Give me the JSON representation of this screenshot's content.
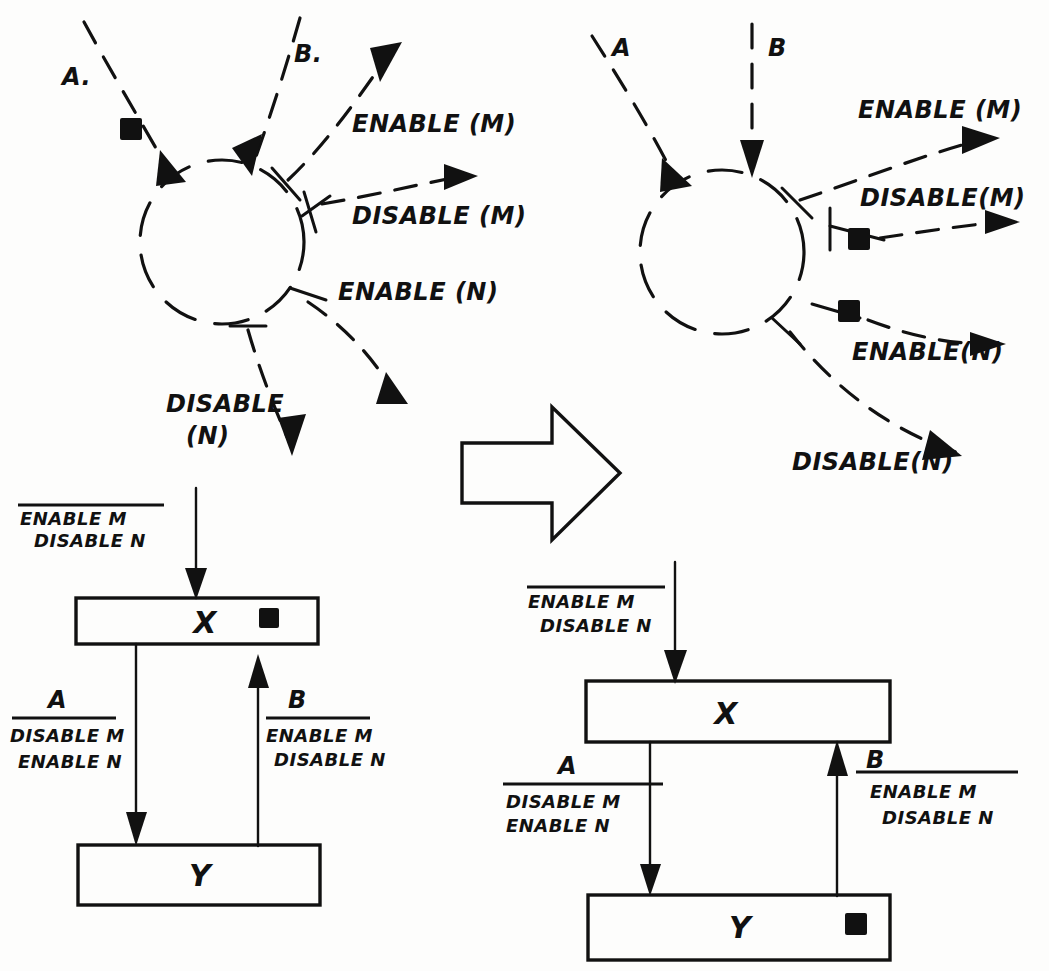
{
  "figure": {
    "transform_arrow": "block-right-arrow"
  },
  "left_net": {
    "inputs": [
      {
        "id": "A",
        "label": "A."
      },
      {
        "id": "B",
        "label": "B."
      }
    ],
    "outputs": [
      {
        "id": "enable_m",
        "label": "ENABLE (M)"
      },
      {
        "id": "disable_m",
        "label": "DISABLE (M)"
      },
      {
        "id": "enable_n",
        "label": "ENABLE (N)"
      },
      {
        "id": "disable_n",
        "label": "DISABLE",
        "label2": "(N)"
      }
    ],
    "tokens": [
      {
        "on": "A",
        "count": 1
      }
    ]
  },
  "right_net": {
    "inputs": [
      {
        "id": "A",
        "label": "A"
      },
      {
        "id": "B",
        "label": "B"
      }
    ],
    "outputs": [
      {
        "id": "enable_m",
        "label": "ENABLE (M)"
      },
      {
        "id": "disable_m",
        "label": "DISABLE(M)"
      },
      {
        "id": "enable_n",
        "label": "ENABLE(N)"
      },
      {
        "id": "disable_n",
        "label": "DISABLE(N)"
      }
    ],
    "tokens": [
      {
        "on": "disable_m",
        "count": 1
      },
      {
        "on": "enable_n",
        "count": 1
      }
    ]
  },
  "left_machine": {
    "entry_label": {
      "line1": "ENABLE M",
      "line2": "DISABLE N"
    },
    "states": [
      {
        "id": "X",
        "label": "X",
        "has_token": true
      },
      {
        "id": "Y",
        "label": "Y",
        "has_token": false
      }
    ],
    "transitions": [
      {
        "id": "A",
        "name": "A",
        "line1": "DISABLE M",
        "line2": "ENABLE N",
        "direction": "down"
      },
      {
        "id": "B",
        "name": "B",
        "line1": "ENABLE M",
        "line2": "DISABLE N",
        "direction": "up"
      }
    ]
  },
  "right_machine": {
    "entry_label": {
      "line1": "ENABLE M",
      "line2": "DISABLE N"
    },
    "states": [
      {
        "id": "X",
        "label": "X",
        "has_token": false
      },
      {
        "id": "Y",
        "label": "Y",
        "has_token": true
      }
    ],
    "transitions": [
      {
        "id": "A",
        "name": "A",
        "line1": "DISABLE M",
        "line2": "ENABLE N",
        "direction": "down"
      },
      {
        "id": "B",
        "name": "B",
        "line1": "ENABLE M",
        "line2": "DISABLE N",
        "direction": "up"
      }
    ]
  },
  "colors": {
    "ink": "#111111",
    "paper": "#fdfdfc"
  }
}
